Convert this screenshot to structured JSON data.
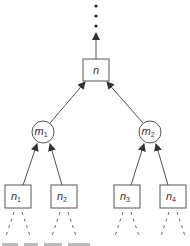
{
  "diagram": {
    "type": "tree",
    "continuation": "vertical-ellipsis",
    "root": {
      "id": "n",
      "label": "n",
      "shape": "box"
    },
    "middle": [
      {
        "id": "m1",
        "label": "m",
        "sub": "1",
        "shape": "circle"
      },
      {
        "id": "m2",
        "label": "m",
        "sub": "2",
        "shape": "circle"
      }
    ],
    "leaves": [
      {
        "id": "n1",
        "label": "n",
        "sub": "1",
        "shape": "box",
        "parent": "m1"
      },
      {
        "id": "n2",
        "label": "n",
        "sub": "2",
        "shape": "box",
        "parent": "m1"
      },
      {
        "id": "n3",
        "label": "n",
        "sub": "3",
        "shape": "box",
        "parent": "m2"
      },
      {
        "id": "n4",
        "label": "n",
        "sub": "4",
        "shape": "box",
        "parent": "m2"
      }
    ],
    "edges": [
      [
        "m1",
        "n"
      ],
      [
        "m2",
        "n"
      ],
      [
        "n1",
        "m1"
      ],
      [
        "n2",
        "m1"
      ],
      [
        "n3",
        "m2"
      ],
      [
        "n4",
        "m2"
      ]
    ],
    "colors": {
      "stroke": "#555555",
      "text": "#333333",
      "background": "#ffffff"
    }
  }
}
